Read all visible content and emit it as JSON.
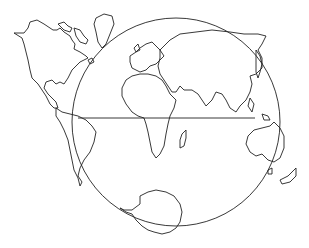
{
  "map": {
    "title": "",
    "style": "outline world map",
    "stroke_color": "#222222",
    "background_color": "#ffffff",
    "regions": [
      "north-america",
      "greenland",
      "south-america",
      "europe",
      "africa",
      "madagascar",
      "asia",
      "japan",
      "australia",
      "new-zealand",
      "antarctica",
      "globe-circle",
      "equator-line"
    ]
  }
}
